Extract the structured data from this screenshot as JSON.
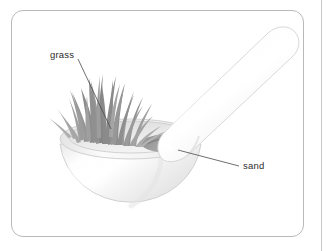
{
  "figure": {
    "background_color": "#ffffff",
    "border_color": "#b9b9b9"
  },
  "labels": [
    {
      "id": "grass",
      "text": "grass",
      "x": 50,
      "y": 49,
      "leader_from": [
        78,
        59
      ],
      "leader_to": [
        111,
        129
      ]
    },
    {
      "id": "sand",
      "text": "sand",
      "x": 243,
      "y": 160,
      "leader_from": [
        178,
        150
      ],
      "leader_to": [
        239,
        166
      ]
    }
  ],
  "objects": {
    "mortar": {
      "name": "mortar bowl",
      "fill_color": "#f3f3f3",
      "outline_color": "#cfcfcf",
      "rim_color": "#e8e8e8"
    },
    "pestle": {
      "name": "pestle",
      "fill_color": "#fafafa",
      "outline_color": "#d6d6d6"
    },
    "grass": {
      "name": "grass blades",
      "blade_color": "#9a9a9a",
      "blade_count": 26
    },
    "sand": {
      "name": "sand patch",
      "fill_color": "#8f8f8f"
    }
  }
}
